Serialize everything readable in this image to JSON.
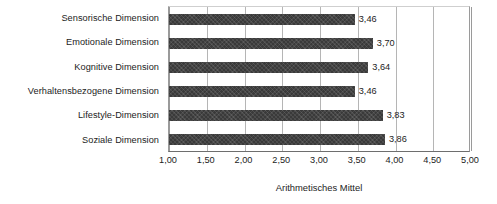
{
  "chart_data": {
    "type": "bar",
    "orientation": "horizontal",
    "title": "",
    "xlabel": "Arithmetisches Mittel",
    "ylabel": "",
    "categories": [
      "Sensorische Dimension",
      "Emotionale Dimension",
      "Kognitive Dimension",
      "Verhaltensbezogene Dimension",
      "Lifestyle-Dimension",
      "Soziale Dimension"
    ],
    "values": [
      3.46,
      3.7,
      3.64,
      3.46,
      3.83,
      3.86
    ],
    "value_labels": [
      "3,46",
      "3,70",
      "3,64",
      "3,46",
      "3,83",
      "3,86"
    ],
    "xlim": [
      1.0,
      5.0
    ],
    "xticks": [
      1.0,
      1.5,
      2.0,
      2.5,
      3.0,
      3.5,
      4.0,
      4.5,
      5.0
    ],
    "xtick_labels": [
      "1,00",
      "1,50",
      "2,00",
      "2,50",
      "3,00",
      "3,50",
      "4,00",
      "4,50",
      "5,00"
    ],
    "grid": "vertical",
    "legend": "none",
    "bar_color": "#3a3a3a",
    "grid_color": "#b5b5b5",
    "axis_color": "#6e6e6e",
    "text_color": "#1c1c1c",
    "background": "#ffffff"
  }
}
